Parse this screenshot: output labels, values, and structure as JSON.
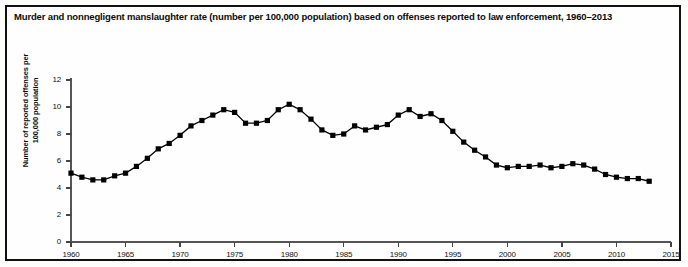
{
  "figure": {
    "title": "Murder and nonnegligent manslaughter rate (number per 100,000 population) based on offenses reported to law enforcement, 1960–2013",
    "frame_color": "#111111",
    "series_color": "#000000",
    "background": "#ffffff"
  },
  "chart_data": {
    "type": "line",
    "title": "Murder and nonnegligent manslaughter rate (number per 100,000 population) based on offenses reported to law enforcement, 1960–2013",
    "xlabel": "",
    "ylabel": "Number of reported offenses per 100,000 population",
    "xlim": [
      1960,
      2015
    ],
    "ylim": [
      0,
      12
    ],
    "xticks": [
      1960,
      1965,
      1970,
      1975,
      1980,
      1985,
      1990,
      1995,
      2000,
      2005,
      2010,
      2015
    ],
    "xtick_labels": [
      "1960",
      "1965",
      "1970",
      "1975",
      "1980",
      "1985",
      "1990",
      "1995",
      "2000",
      "2005",
      "2010",
      "2015"
    ],
    "yticks": [
      0,
      2,
      4,
      6,
      8,
      10,
      12
    ],
    "ytick_labels": [
      "0",
      "2",
      "4",
      "6",
      "8",
      "10",
      "12"
    ],
    "grid": false,
    "legend": null,
    "marker": "square",
    "x": [
      1960,
      1961,
      1962,
      1963,
      1964,
      1965,
      1966,
      1967,
      1968,
      1969,
      1970,
      1971,
      1972,
      1973,
      1974,
      1975,
      1976,
      1977,
      1978,
      1979,
      1980,
      1981,
      1982,
      1983,
      1984,
      1985,
      1986,
      1987,
      1988,
      1989,
      1990,
      1991,
      1992,
      1993,
      1994,
      1995,
      1996,
      1997,
      1998,
      1999,
      2000,
      2001,
      2002,
      2003,
      2004,
      2005,
      2006,
      2007,
      2008,
      2009,
      2010,
      2011,
      2012,
      2013
    ],
    "values": [
      5.1,
      4.8,
      4.6,
      4.6,
      4.9,
      5.1,
      5.6,
      6.2,
      6.9,
      7.3,
      7.9,
      8.6,
      9.0,
      9.4,
      9.8,
      9.6,
      8.8,
      8.8,
      9.0,
      9.8,
      10.2,
      9.8,
      9.1,
      8.3,
      7.9,
      8.0,
      8.6,
      8.3,
      8.5,
      8.7,
      9.4,
      9.8,
      9.3,
      9.5,
      9.0,
      8.2,
      7.4,
      6.8,
      6.3,
      5.7,
      5.5,
      5.6,
      5.6,
      5.7,
      5.5,
      5.6,
      5.8,
      5.7,
      5.4,
      5.0,
      4.8,
      4.7,
      4.7,
      4.5
    ],
    "series": [
      {
        "name": "Murder and nonnegligent manslaughter rate per 100,000",
        "values": [
          5.1,
          4.8,
          4.6,
          4.6,
          4.9,
          5.1,
          5.6,
          6.2,
          6.9,
          7.3,
          7.9,
          8.6,
          9.0,
          9.4,
          9.8,
          9.6,
          8.8,
          8.8,
          9.0,
          9.8,
          10.2,
          9.8,
          9.1,
          8.3,
          7.9,
          8.0,
          8.6,
          8.3,
          8.5,
          8.7,
          9.4,
          9.8,
          9.3,
          9.5,
          9.0,
          8.2,
          7.4,
          6.8,
          6.3,
          5.7,
          5.5,
          5.6,
          5.6,
          5.7,
          5.5,
          5.6,
          5.8,
          5.7,
          5.4,
          5.0,
          4.8,
          4.7,
          4.7,
          4.5
        ]
      }
    ]
  }
}
